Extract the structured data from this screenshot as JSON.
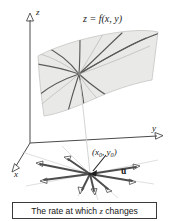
{
  "figure": {
    "kind": "3d-surface-directional-derivative-diagram",
    "background_color": "#ffffff",
    "width": 169,
    "height": 221
  },
  "axes": {
    "z_label": "z",
    "y_label": "y",
    "x_label": "x",
    "origin": [
      30,
      143
    ],
    "axis_color": "#4a4a4a"
  },
  "surface": {
    "label": "z = f(x, y)",
    "fill_color": "#e9e9e7",
    "edge_color": "#b8b8b6",
    "curve_color": "#5a5a5a",
    "focal_point": [
      79,
      74
    ]
  },
  "base_point": {
    "label_open": "(",
    "label_x": "x",
    "label_x_sub": "0",
    "label_sep": ", ",
    "label_y": "y",
    "label_y_sub": "0",
    "label_close": ")",
    "position": [
      90,
      174
    ],
    "vector_label": "u",
    "vector_color": "#4d4d4d",
    "guide_color": "#c9c9c9"
  },
  "caption": {
    "text_before": "The rate at which ",
    "italic_term": "z",
    "text_after": " changes",
    "border_color": "#3a3a3a"
  }
}
